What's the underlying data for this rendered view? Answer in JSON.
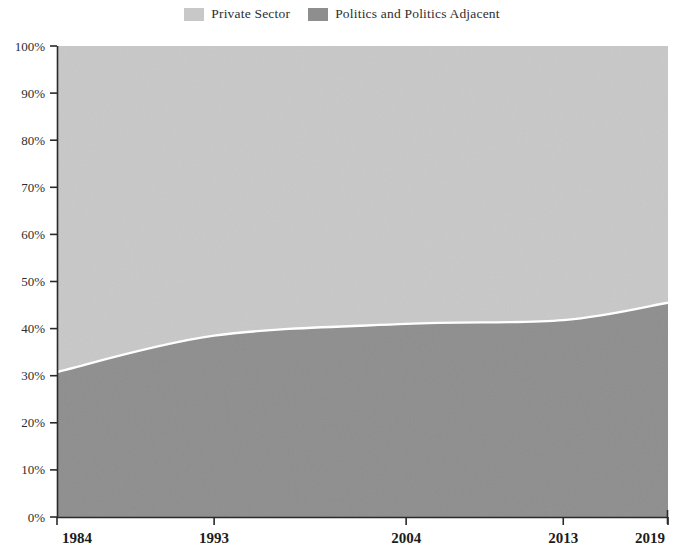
{
  "legend": {
    "position": "top-center",
    "items": [
      {
        "label": "Private Sector",
        "color": "#c8c8c8",
        "swatch_name": "legend-swatch-private-sector"
      },
      {
        "label": "Politics and Politics Adjacent",
        "color": "#8e8e8e",
        "swatch_name": "legend-swatch-politics"
      }
    ]
  },
  "axes": {
    "y_ticks": [
      "0%",
      "10%",
      "20%",
      "30%",
      "40%",
      "50%",
      "60%",
      "70%",
      "80%",
      "90%",
      "100%"
    ],
    "x_ticks": [
      "1984",
      "1993",
      "2004",
      "2013",
      "2019"
    ]
  },
  "chart_data": {
    "type": "area",
    "title": "",
    "subtitle": "",
    "xlabel": "",
    "ylabel": "",
    "stacked": true,
    "normalized_100_percent": true,
    "grid": false,
    "legend_position": "top-center",
    "x": [
      1984,
      1993,
      2004,
      2013,
      2019
    ],
    "categories": [
      "1984",
      "1993",
      "2004",
      "2013",
      "2019"
    ],
    "xlim": [
      1984,
      2019
    ],
    "ylim": [
      0,
      100
    ],
    "ytick_values": [
      0,
      10,
      20,
      30,
      40,
      50,
      60,
      70,
      80,
      90,
      100
    ],
    "ytick_labels": [
      "0%",
      "10%",
      "20%",
      "30%",
      "40%",
      "50%",
      "60%",
      "70%",
      "80%",
      "90%",
      "100%"
    ],
    "xtick_values": [
      1984,
      1993,
      2004,
      2013,
      2019
    ],
    "xtick_labels": [
      "1984",
      "1993",
      "2004",
      "2013",
      "2019"
    ],
    "series": [
      {
        "name": "Politics and Politics Adjacent",
        "color": "#8e8e8e",
        "stack_order": "bottom",
        "values": [
          30.8,
          38.5,
          41.0,
          41.8,
          45.5
        ]
      },
      {
        "name": "Private Sector",
        "color": "#c8c8c8",
        "stack_order": "top",
        "values": [
          69.2,
          61.5,
          59.0,
          58.2,
          54.5
        ]
      }
    ],
    "boundary_points_percent": [
      {
        "x": 1984,
        "y": 30.8
      },
      {
        "x": 1993,
        "y": 38.5
      },
      {
        "x": 2004,
        "y": 41.0
      },
      {
        "x": 2013,
        "y": 41.8
      },
      {
        "x": 2019,
        "y": 45.5
      }
    ],
    "annotations": []
  }
}
